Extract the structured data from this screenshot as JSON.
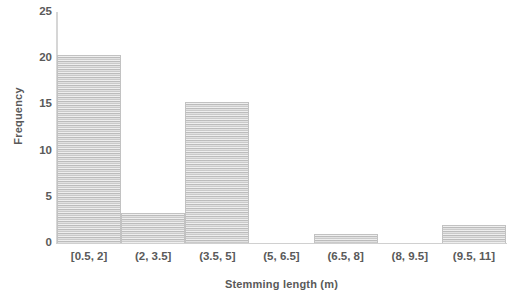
{
  "chart_data": {
    "type": "bar",
    "title": "",
    "subtitle": "",
    "xlabel": "Stemming length (m)",
    "ylabel": "Frequency",
    "categories": [
      "[0.5, 2]",
      "(2, 3.5]",
      "(3.5, 5]",
      "(5, 6.5]",
      "(6.5, 8]",
      "(8, 9.5]",
      "(9.5, 11]"
    ],
    "values": [
      20.3,
      3.3,
      15.3,
      0,
      1,
      0,
      2
    ],
    "ylim": [
      0,
      25
    ],
    "yticks": [
      0,
      5,
      10,
      15,
      20,
      25
    ],
    "ytick_labels": [
      "0",
      "5",
      "10",
      "15",
      "20",
      "25"
    ],
    "grid": false,
    "legend": null,
    "series": [
      {
        "name": "Frequency",
        "values": [
          20.3,
          3.3,
          15.3,
          0,
          1,
          0,
          2
        ],
        "fill": "#d4d4d4",
        "edge": "#c2c2c2",
        "pattern": "horizontal-stripe"
      }
    ],
    "annotations": []
  },
  "axes": {
    "y_title": "Frequency",
    "x_title": "Stemming length (m)",
    "axis_color": "#d4d4d4",
    "label_color": "#5a5a5a"
  },
  "ytick_positions_pct": [
    0,
    20,
    40,
    60,
    80,
    100
  ]
}
